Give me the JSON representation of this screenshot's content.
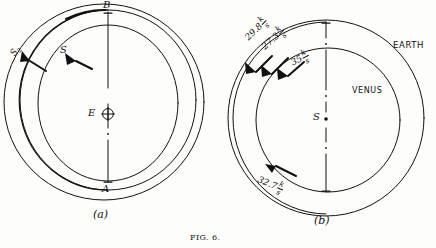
{
  "figure": {
    "caption": "FIG. 6.",
    "panels": [
      {
        "id": "a",
        "caption": "(a)",
        "center_label": "E",
        "center_symbol": "⊕",
        "point_top": "B",
        "point_bottom": "A",
        "arrow_label_outer": "S",
        "arrow_label_outer_sub": "2",
        "arrow_label_inner": "S"
      },
      {
        "id": "b",
        "caption": "(b)",
        "center_label": "S",
        "orbit_outer_label": "EARTH",
        "orbit_inner_label": "VENUS",
        "velocities": [
          {
            "value": "29.8",
            "unit_num": "k",
            "unit_den": "s",
            "position": "outer-upper-left"
          },
          {
            "value": "27.3",
            "unit_num": "k",
            "unit_den": "s",
            "position": "middle-upper-left"
          },
          {
            "value": "35",
            "unit_num": "k",
            "unit_den": "s",
            "position": "inner-upper-left"
          },
          {
            "value": "32.7",
            "unit_num": "k",
            "unit_den": "s",
            "position": "lower-left"
          }
        ]
      }
    ]
  },
  "colors": {
    "ink": "#111111",
    "paper": "#fdfdfb"
  }
}
